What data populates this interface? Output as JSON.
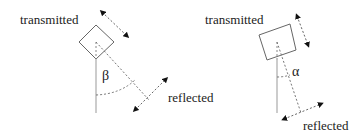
{
  "colors": {
    "stroke": "#555555",
    "text": "#222222",
    "background": "#ffffff"
  },
  "left_panel": {
    "transmitted_label": "transmitted",
    "reflected_label": "reflected",
    "angle_symbol": "β"
  },
  "right_panel": {
    "transmitted_label": "transmitted",
    "reflected_label": "reflected",
    "angle_symbol": "α"
  }
}
